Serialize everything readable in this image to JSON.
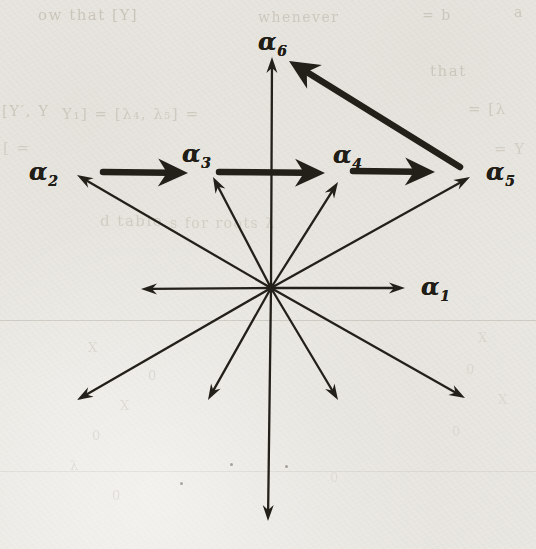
{
  "figure": {
    "type": "vector-star-diagram",
    "ink_color": "#231f19",
    "paper_color": "#eae8e2",
    "origin": {
      "x": 271,
      "y": 288
    },
    "labels": [
      {
        "name": "alpha-6",
        "base": "α",
        "sub": "6",
        "x": 272,
        "y": 42
      },
      {
        "name": "alpha-2",
        "base": "α",
        "sub": "2",
        "x": 43,
        "y": 172
      },
      {
        "name": "alpha-3",
        "base": "α",
        "sub": "3",
        "x": 196,
        "y": 154
      },
      {
        "name": "alpha-4",
        "base": "α",
        "sub": "4",
        "x": 347,
        "y": 155
      },
      {
        "name": "alpha-5",
        "base": "α",
        "sub": "5",
        "x": 500,
        "y": 172
      },
      {
        "name": "alpha-1",
        "base": "α",
        "sub": "1",
        "x": 435,
        "y": 287
      }
    ],
    "thin_rays": [
      {
        "name": "ray-up-alpha6",
        "to": [
          272,
          57
        ]
      },
      {
        "name": "ray-upper-right-60",
        "to": [
          338,
          182
        ]
      },
      {
        "name": "ray-upper-right-30-alpha5",
        "to": [
          470,
          177
        ]
      },
      {
        "name": "ray-right-alpha1",
        "to": [
          405,
          288
        ]
      },
      {
        "name": "ray-lower-right-30",
        "to": [
          465,
          398
        ]
      },
      {
        "name": "ray-lower-right-60",
        "to": [
          338,
          400
        ]
      },
      {
        "name": "ray-down",
        "to": [
          268,
          521
        ]
      },
      {
        "name": "ray-lower-left-60",
        "to": [
          208,
          400
        ]
      },
      {
        "name": "ray-lower-left-30",
        "to": [
          77,
          400
        ]
      },
      {
        "name": "ray-left",
        "to": [
          141,
          289
        ]
      },
      {
        "name": "ray-upper-left-60-alpha3",
        "to": [
          213,
          177
        ]
      },
      {
        "name": "ray-upper-left-30-alpha2",
        "to": [
          77,
          175
        ]
      }
    ],
    "bold_arrows": [
      {
        "name": "step-alpha2-to-alpha3",
        "from": [
          103,
          172
        ],
        "to": [
          188,
          173
        ]
      },
      {
        "name": "step-alpha3-to-alpha4",
        "from": [
          219,
          172
        ],
        "to": [
          325,
          173
        ]
      },
      {
        "name": "step-alpha4-to-alpha5",
        "from": [
          353,
          171
        ],
        "to": [
          435,
          172
        ]
      },
      {
        "name": "step-alpha5-to-alpha6",
        "from": [
          460,
          167
        ],
        "to": [
          289,
          61
        ]
      }
    ]
  },
  "artifacts": {
    "rule_lines": [
      {
        "y": 320,
        "opacity": 0.3
      },
      {
        "y": 471,
        "opacity": 0.14
      }
    ],
    "bleedthrough_fragments": [
      {
        "text": "ow that [Y]",
        "x": 38,
        "y": 6,
        "size": 15,
        "o": 0.55
      },
      {
        "text": "whenever",
        "x": 258,
        "y": 9,
        "size": 14,
        "o": 0.5
      },
      {
        "text": "= b",
        "x": 422,
        "y": 7,
        "size": 14,
        "o": 0.5
      },
      {
        "text": "a",
        "x": 514,
        "y": 4,
        "size": 14,
        "o": 0.5
      },
      {
        "text": "that",
        "x": 430,
        "y": 62,
        "size": 15,
        "o": 0.5
      },
      {
        "text": "[Y′, Y",
        "x": 2,
        "y": 102,
        "size": 15,
        "o": 0.5
      },
      {
        "text": "Y₁] = [λ₄, λ₅] =",
        "x": 62,
        "y": 105,
        "size": 15,
        "o": 0.45
      },
      {
        "text": "= [λ",
        "x": 468,
        "y": 100,
        "size": 15,
        "o": 0.45
      },
      {
        "text": "[ =",
        "x": 3,
        "y": 139,
        "size": 15,
        "o": 0.4
      },
      {
        "text": "= Y",
        "x": 494,
        "y": 140,
        "size": 15,
        "o": 0.4
      },
      {
        "text": "d table",
        "x": 100,
        "y": 212,
        "size": 15,
        "o": 0.42
      },
      {
        "text": "s for roots λ",
        "x": 170,
        "y": 215,
        "size": 14,
        "o": 0.38
      },
      {
        "text": "X",
        "x": 88,
        "y": 340,
        "size": 13,
        "o": 0.3
      },
      {
        "text": "0",
        "x": 148,
        "y": 368,
        "size": 13,
        "o": 0.3
      },
      {
        "text": "X",
        "x": 120,
        "y": 398,
        "size": 13,
        "o": 0.28
      },
      {
        "text": "0",
        "x": 92,
        "y": 428,
        "size": 13,
        "o": 0.28
      },
      {
        "text": "λ",
        "x": 70,
        "y": 458,
        "size": 13,
        "o": 0.26
      },
      {
        "text": "0",
        "x": 112,
        "y": 488,
        "size": 13,
        "o": 0.26
      },
      {
        "text": "X",
        "x": 478,
        "y": 330,
        "size": 13,
        "o": 0.28
      },
      {
        "text": "0",
        "x": 466,
        "y": 362,
        "size": 13,
        "o": 0.26
      },
      {
        "text": "X",
        "x": 498,
        "y": 392,
        "size": 13,
        "o": 0.24
      },
      {
        "text": "0",
        "x": 452,
        "y": 424,
        "size": 13,
        "o": 0.22
      },
      {
        "text": "0",
        "x": 330,
        "y": 470,
        "size": 13,
        "o": 0.2
      }
    ],
    "specks": [
      {
        "x": 230,
        "y": 463
      },
      {
        "x": 285,
        "y": 465
      },
      {
        "x": 180,
        "y": 482
      }
    ]
  }
}
